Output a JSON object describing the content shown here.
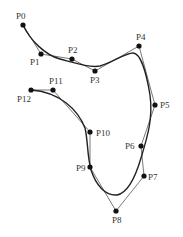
{
  "diagram": {
    "type": "b-spline-control-polygon",
    "colors": {
      "curve": "#222222",
      "polygon": "#555555",
      "point": "#111111",
      "label": "#333333"
    },
    "control_points": [
      {
        "label": "P0",
        "x": 23,
        "y": 25,
        "lx": 16,
        "ly": 19,
        "anchor": "start"
      },
      {
        "label": "P1",
        "x": 41,
        "y": 54,
        "lx": 30,
        "ly": 65,
        "anchor": "start"
      },
      {
        "label": "P2",
        "x": 72,
        "y": 59,
        "lx": 68,
        "ly": 53,
        "anchor": "start"
      },
      {
        "label": "P3",
        "x": 95,
        "y": 71,
        "lx": 90,
        "ly": 83,
        "anchor": "start"
      },
      {
        "label": "P4",
        "x": 139,
        "y": 46,
        "lx": 136,
        "ly": 40,
        "anchor": "start"
      },
      {
        "label": "P5",
        "x": 155,
        "y": 105,
        "lx": 160,
        "ly": 108,
        "anchor": "start"
      },
      {
        "label": "P6",
        "x": 141,
        "y": 146,
        "lx": 125,
        "ly": 149,
        "anchor": "start"
      },
      {
        "label": "P7",
        "x": 144,
        "y": 176,
        "lx": 148,
        "ly": 180,
        "anchor": "start"
      },
      {
        "label": "P8",
        "x": 116,
        "y": 211,
        "lx": 112,
        "ly": 223,
        "anchor": "start"
      },
      {
        "label": "P9",
        "x": 90,
        "y": 167,
        "lx": 76,
        "ly": 171,
        "anchor": "start"
      },
      {
        "label": "P10",
        "x": 90,
        "y": 132,
        "lx": 96,
        "ly": 136,
        "anchor": "start"
      },
      {
        "label": "P11",
        "x": 53,
        "y": 90,
        "lx": 49,
        "ly": 84,
        "anchor": "start"
      },
      {
        "label": "P12",
        "x": 31,
        "y": 90,
        "lx": 17,
        "ly": 102,
        "anchor": "start"
      }
    ],
    "curve_path": "M23,25 C30,40 45,55 60,59 C75,63 90,68 100,66 C112,63 125,53 133,53 C140,53 146,70 150,95 C153,118 148,135 141,158 C136,175 128,193 117,195 C105,196 96,185 91,170 C87,155 88,140 85,128 C78,110 60,92 31,90"
  }
}
